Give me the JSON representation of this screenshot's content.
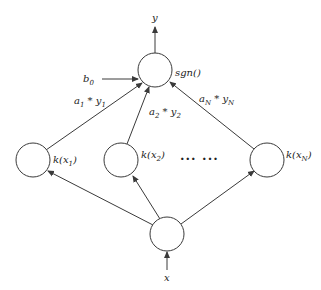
{
  "diagram": {
    "title": "",
    "type": "support-vector-machine-network",
    "colors": {
      "stroke": "#3a3a3a",
      "text": "#222222",
      "background": "#ffffff"
    },
    "nodes": {
      "output": {
        "label": "sgn()",
        "input_arrow_label": "b",
        "input_arrow_label_sub": "0",
        "output_label": "y"
      },
      "kernels": [
        {
          "label_prefix": "k(x",
          "label_sub": "1",
          "label_suffix": ")"
        },
        {
          "label_prefix": "k(x",
          "label_sub": "2",
          "label_suffix": ")"
        },
        {
          "label_prefix": "k(x",
          "label_sub": "N",
          "label_suffix": ")"
        }
      ],
      "ellipsis": "··· ···",
      "input": {
        "label": "x"
      }
    },
    "edges": [
      {
        "from": "k(x1)",
        "to": "sgn()",
        "label_a": "a",
        "label_a_sub": "1",
        "label_op": " * ",
        "label_y": "y",
        "label_y_sub": "1"
      },
      {
        "from": "k(x2)",
        "to": "sgn()",
        "label_a": "a",
        "label_a_sub": "2",
        "label_op": " * ",
        "label_y": "y",
        "label_y_sub": "2"
      },
      {
        "from": "k(xN)",
        "to": "sgn()",
        "label_a": "a",
        "label_a_sub": "N",
        "label_op": " * ",
        "label_y": "y",
        "label_y_sub": "N"
      }
    ]
  }
}
